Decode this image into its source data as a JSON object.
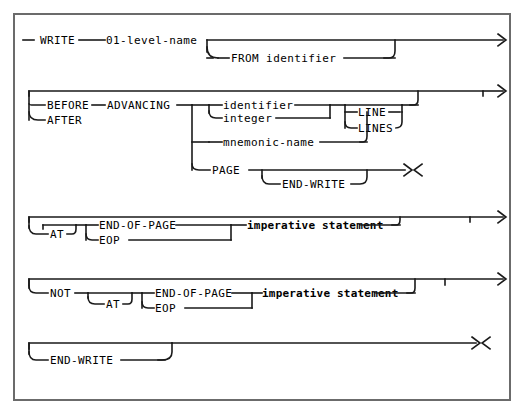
{
  "diagram": {
    "type": "railroad-syntax-diagram",
    "language": "COBOL",
    "statement": "WRITE",
    "colors": {
      "background": "#ffffff",
      "rail": "#1a1a1a",
      "border": "#6b6b6b",
      "text": "#000000"
    },
    "lines": [
      {
        "id": "line-1",
        "terminals": [
          "WRITE",
          "01-level-name",
          "FROM identifier"
        ],
        "entry_marker": "-",
        "exit_marker": ">",
        "optional_branch": "FROM identifier"
      },
      {
        "id": "line-2",
        "terminals": [
          "BEFORE",
          "AFTER",
          "ADVANCING",
          "identifier",
          "integer",
          "LINE",
          "LINES",
          "mnemonic-name",
          "PAGE",
          "END-WRITE"
        ],
        "exit_marker": ">",
        "exit_marker_alt": "><"
      },
      {
        "id": "line-3",
        "terminals": [
          "AT",
          "END-OF-PAGE",
          "EOP",
          "imperative statement"
        ],
        "exit_marker": ">"
      },
      {
        "id": "line-4",
        "terminals": [
          "NOT",
          "AT",
          "END-OF-PAGE",
          "EOP",
          "imperative statement"
        ],
        "exit_marker": ">"
      },
      {
        "id": "line-5",
        "terminals": [
          "END-WRITE"
        ],
        "exit_marker": "><"
      }
    ]
  },
  "labels": {
    "write": "WRITE",
    "level_name": "01-level-name",
    "from_identifier": "FROM identifier",
    "before": "BEFORE",
    "after": "AFTER",
    "advancing": "ADVANCING",
    "identifier": "identifier",
    "integer": "integer",
    "line": "LINE",
    "lines": "LINES",
    "mnemonic_name": "mnemonic-name",
    "page": "PAGE",
    "end_write_1": "END-WRITE",
    "at_1": "AT",
    "end_of_page_1": "END-OF-PAGE",
    "eop_1": "EOP",
    "imperative_statement_1": "imperative statement",
    "not": "NOT",
    "at_2": "AT",
    "end_of_page_2": "END-OF-PAGE",
    "eop_2": "EOP",
    "imperative_statement_2": "imperative statement",
    "end_write_2": "END-WRITE"
  },
  "markers": {
    "entry_dash": "─",
    "arrow_right_1": "〉",
    "arrow_right_2": "〉",
    "arrow_right_3": "〉",
    "arrow_right_4": "〉",
    "terminator_1": "〉〈",
    "terminator_2": "〉〈"
  }
}
